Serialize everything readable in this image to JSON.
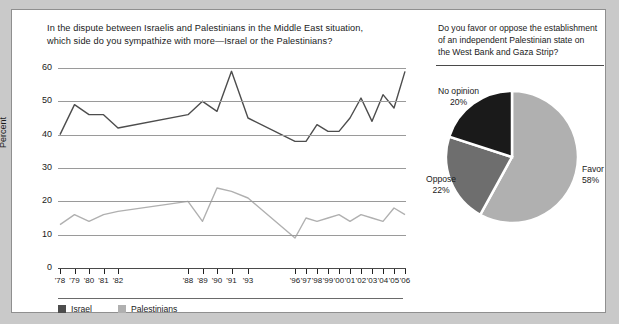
{
  "line_panel": {
    "title_line1": "In the dispute between Israelis and Palestinians in the Middle East situation,",
    "title_line2": "which side do you sympathize with more—Israel or the Palestinians?",
    "legend": [
      {
        "label": "Israel",
        "color": "#4d4d4d"
      },
      {
        "label": "Palestinians",
        "color": "#b0b0b0"
      }
    ]
  },
  "pie_panel": {
    "title_line1": "Do you favor or oppose the establishment",
    "title_line2": "of an independent Palestinian state on",
    "title_line3": "the West Bank and Gaza Strip?"
  },
  "chart_data": [
    {
      "type": "line",
      "title": "In the dispute between Israelis and Palestinians in the Middle East situation, which side do you sympathize with more—Israel or the Palestinians?",
      "xlabel": "",
      "ylabel": "Percent",
      "ylim": [
        0,
        60
      ],
      "yticks": [
        0,
        10,
        20,
        30,
        40,
        50,
        60
      ],
      "grid": true,
      "legend_position": "bottom-left",
      "x": [
        "'78",
        "'79",
        "'80",
        "'81",
        "'82",
        "'88",
        "'89",
        "'90",
        "'91",
        "'93",
        "'96",
        "'97",
        "'98",
        "'99",
        "'00",
        "'01",
        "'02",
        "'03",
        "'04",
        "'05",
        "'06"
      ],
      "tick_labels": [
        "'78",
        "'79",
        "'80",
        "'81",
        "'82",
        "'88",
        "'89",
        "'90",
        "'91",
        "'93",
        "'96",
        "'97",
        "'98",
        "'99",
        "'00",
        "'01",
        "'02",
        "'03",
        "'04",
        "'05",
        "'06"
      ],
      "series": [
        {
          "name": "Israel",
          "color": "#4d4d4d",
          "values": [
            40,
            49,
            46,
            46,
            42,
            46,
            50,
            47,
            59,
            45,
            38,
            38,
            43,
            41,
            41,
            45,
            51,
            44,
            52,
            48,
            59
          ]
        },
        {
          "name": "Palestinians",
          "color": "#b0b0b0",
          "values": [
            13,
            16,
            14,
            16,
            17,
            20,
            14,
            24,
            23,
            21,
            9,
            15,
            14,
            15,
            16,
            14,
            16,
            15,
            14,
            18,
            16
          ]
        }
      ]
    },
    {
      "type": "pie",
      "title": "Do you favor or oppose the establishment of an independent Palestinian state on the West Bank and Gaza Strip?",
      "labels": [
        "Favor",
        "Oppose",
        "No opinion"
      ],
      "values": [
        58,
        22,
        20
      ],
      "value_labels": [
        "58%",
        "22%",
        "20%"
      ],
      "colors": [
        "#b0b0b0",
        "#6e6e6e",
        "#1a1a1a"
      ]
    }
  ]
}
